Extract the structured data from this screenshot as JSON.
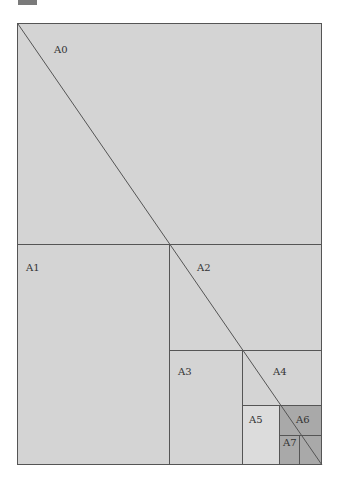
{
  "diagram": {
    "colors": {
      "base": "#d4d4d4",
      "light": "#dcdcdc",
      "dark": "#a9a9a9",
      "line": "#555555",
      "swatch": "#7a7a7a"
    },
    "labels": {
      "a0": "A0",
      "a1": "A1",
      "a2": "A2",
      "a3": "A3",
      "a4": "A4",
      "a5": "A5",
      "a6": "A6",
      "a7": "A7"
    }
  }
}
